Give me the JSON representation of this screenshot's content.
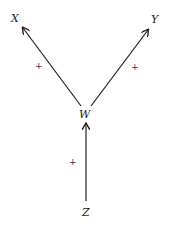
{
  "diagram": {
    "nodes": [
      {
        "id": "X",
        "label": "X",
        "x": 15,
        "y": 22
      },
      {
        "id": "Y",
        "label": "Y",
        "x": 155,
        "y": 23
      },
      {
        "id": "W",
        "label": "W",
        "x": 85,
        "y": 117
      },
      {
        "id": "Z",
        "label": "Z",
        "x": 86,
        "y": 216
      }
    ],
    "edges": [
      {
        "from": "W",
        "to": "X",
        "sign": "+"
      },
      {
        "from": "W",
        "to": "Y",
        "sign": "+"
      },
      {
        "from": "Z",
        "to": "W",
        "sign": "+"
      }
    ],
    "labels": {
      "x": "X",
      "y": "Y",
      "w": "W",
      "z": "Z",
      "sign_wx": "+",
      "sign_wy": "+",
      "sign_zw": "+"
    },
    "colors": {
      "line": "#222222",
      "background": "#ffffff"
    }
  }
}
